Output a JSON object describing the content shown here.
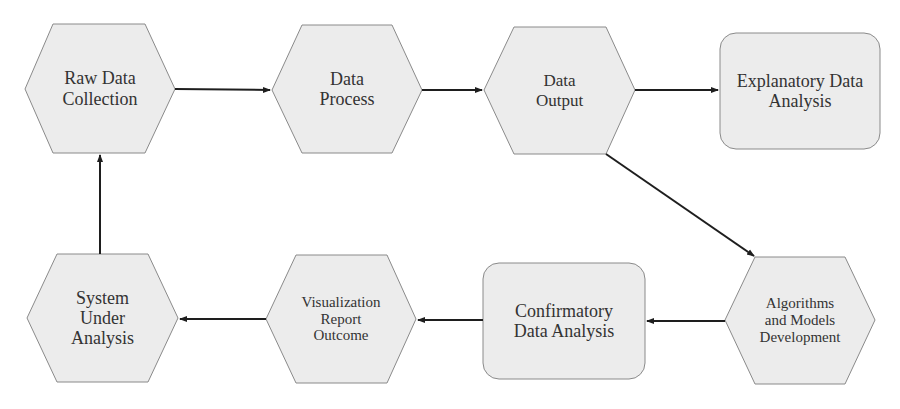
{
  "diagram": {
    "colors": {
      "node_fill": "#ececec",
      "node_stroke": "#8a8a8a",
      "arrow": "#1e1e1e",
      "text": "#333333"
    },
    "nodes": [
      {
        "id": "raw-data-collection",
        "shape": "hexagon",
        "lines": [
          "Raw Data",
          "Collection"
        ]
      },
      {
        "id": "data-process",
        "shape": "hexagon",
        "lines": [
          "Data",
          "Process"
        ]
      },
      {
        "id": "data-output",
        "shape": "hexagon",
        "lines": [
          "Data",
          "Output"
        ]
      },
      {
        "id": "explanatory-data-analysis",
        "shape": "rounded-rect",
        "lines": [
          "Explanatory Data",
          "Analysis"
        ]
      },
      {
        "id": "algorithms-models-development",
        "shape": "hexagon",
        "lines": [
          "Algorithms",
          "and Models",
          "Development"
        ]
      },
      {
        "id": "confirmatory-data-analysis",
        "shape": "rounded-rect",
        "lines": [
          "Confirmatory",
          "Data Analysis"
        ]
      },
      {
        "id": "visualization-report-outcome",
        "shape": "hexagon",
        "lines": [
          "Visualization",
          "Report",
          "Outcome"
        ]
      },
      {
        "id": "system-under-analysis",
        "shape": "hexagon",
        "lines": [
          "System",
          "Under",
          "Analysis"
        ]
      }
    ],
    "edges": [
      {
        "from": "raw-data-collection",
        "to": "data-process"
      },
      {
        "from": "data-process",
        "to": "data-output"
      },
      {
        "from": "data-output",
        "to": "explanatory-data-analysis"
      },
      {
        "from": "data-output",
        "to": "algorithms-models-development"
      },
      {
        "from": "algorithms-models-development",
        "to": "confirmatory-data-analysis"
      },
      {
        "from": "confirmatory-data-analysis",
        "to": "visualization-report-outcome"
      },
      {
        "from": "visualization-report-outcome",
        "to": "system-under-analysis"
      },
      {
        "from": "system-under-analysis",
        "to": "raw-data-collection"
      }
    ]
  }
}
